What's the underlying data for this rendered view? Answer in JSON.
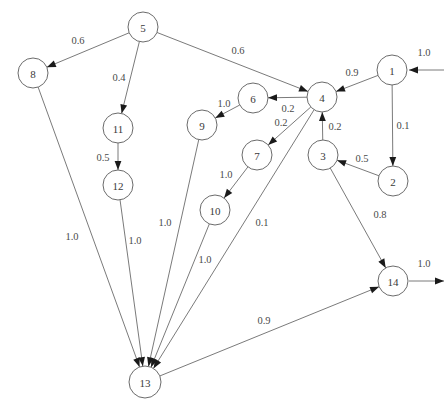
{
  "diagram": {
    "type": "directed-graph",
    "colors": {
      "background": "#ffffff",
      "node_stroke": "#6b6b6b",
      "node_fill": "#ffffff",
      "edge_stroke": "#6b6b6b",
      "arrow_fill": "#1a1a1a",
      "label_text": "#4a4a4a",
      "node_text": "#3a3a3a"
    },
    "nodes": [
      {
        "id": "1",
        "label": "1",
        "x": 392,
        "y": 70,
        "r": 15
      },
      {
        "id": "2",
        "label": "2",
        "x": 393,
        "y": 181,
        "r": 15
      },
      {
        "id": "3",
        "label": "3",
        "x": 323,
        "y": 155,
        "r": 15
      },
      {
        "id": "4",
        "label": "4",
        "x": 322,
        "y": 97,
        "r": 15
      },
      {
        "id": "5",
        "label": "5",
        "x": 143,
        "y": 27,
        "r": 15
      },
      {
        "id": "6",
        "label": "6",
        "x": 253,
        "y": 98,
        "r": 15
      },
      {
        "id": "7",
        "label": "7",
        "x": 257,
        "y": 155,
        "r": 15
      },
      {
        "id": "8",
        "label": "8",
        "x": 33,
        "y": 73,
        "r": 15
      },
      {
        "id": "9",
        "label": "9",
        "x": 202,
        "y": 125,
        "r": 15
      },
      {
        "id": "10",
        "label": "10",
        "x": 215,
        "y": 210,
        "r": 15
      },
      {
        "id": "11",
        "label": "11",
        "x": 118,
        "y": 128,
        "r": 15
      },
      {
        "id": "12",
        "label": "12",
        "x": 118,
        "y": 185,
        "r": 15
      },
      {
        "id": "13",
        "label": "13",
        "x": 145,
        "y": 382,
        "r": 16
      },
      {
        "id": "14",
        "label": "14",
        "x": 393,
        "y": 281,
        "r": 15
      }
    ],
    "edges": [
      {
        "from": "5",
        "to": "8",
        "weight": "0.6",
        "lx": 78,
        "ly": 40
      },
      {
        "from": "5",
        "to": "11",
        "weight": "0.4",
        "lx": 119,
        "ly": 77
      },
      {
        "from": "5",
        "to": "4",
        "weight": "0.6",
        "lx": 238,
        "ly": 50
      },
      {
        "from": "11",
        "to": "12",
        "weight": "0.5",
        "lx": 103,
        "ly": 157
      },
      {
        "from": "1",
        "to": "4",
        "weight": "0.9",
        "lx": 352,
        "ly": 72
      },
      {
        "from": "1",
        "to": "2",
        "weight": "0.1",
        "lx": 403,
        "ly": 125
      },
      {
        "from": "2",
        "to": "3",
        "weight": "0.5",
        "lx": 362,
        "ly": 158
      },
      {
        "from": "3",
        "to": "4",
        "weight": "0.2",
        "lx": 335,
        "ly": 126
      },
      {
        "from": "3",
        "to": "14",
        "weight": "0.8",
        "lx": 380,
        "ly": 214
      },
      {
        "from": "4",
        "to": "6",
        "weight": "0.2",
        "lx": 288,
        "ly": 108
      },
      {
        "from": "4",
        "to": "7",
        "weight": "0.2",
        "lx": 281,
        "ly": 122
      },
      {
        "from": "6",
        "to": "9",
        "weight": "1.0",
        "lx": 224,
        "ly": 103
      },
      {
        "from": "7",
        "to": "10",
        "weight": "1.0",
        "lx": 226,
        "ly": 174
      },
      {
        "from": "8",
        "to": "13",
        "weight": "1.0",
        "lx": 72,
        "ly": 236
      },
      {
        "from": "12",
        "to": "13",
        "weight": "1.0",
        "lx": 135,
        "ly": 240
      },
      {
        "from": "9",
        "to": "13",
        "weight": "1.0",
        "lx": 165,
        "ly": 222
      },
      {
        "from": "10",
        "to": "13",
        "weight": "1.0",
        "lx": 205,
        "ly": 259
      },
      {
        "from": "4",
        "to": "13",
        "weight": "0.1",
        "lx": 262,
        "ly": 222
      },
      {
        "from": "13",
        "to": "14",
        "weight": "0.9",
        "lx": 264,
        "ly": 320
      }
    ],
    "external_edges": [
      {
        "name": "source-inflow-to-1",
        "to": "1",
        "weight": "1.0",
        "lx": 424,
        "ly": 52,
        "x1": 444,
        "y1": 70,
        "x2": 409,
        "y2": 70
      },
      {
        "name": "sink-outflow-from-14",
        "from": "14",
        "weight": "1.0",
        "lx": 424,
        "ly": 263,
        "x1": 409,
        "y1": 281,
        "x2": 444,
        "y2": 281
      }
    ]
  }
}
